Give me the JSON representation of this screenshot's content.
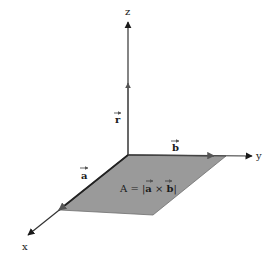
{
  "diagram": {
    "type": "3d-vector-parallelogram",
    "axes": [
      {
        "name": "z",
        "label": "z"
      },
      {
        "name": "y",
        "label": "y"
      },
      {
        "name": "x",
        "label": "x"
      }
    ],
    "vectors": [
      {
        "name": "r",
        "label": "r",
        "along": "z"
      },
      {
        "name": "a",
        "label": "a",
        "along": "x"
      },
      {
        "name": "b",
        "label": "b",
        "along": "y"
      }
    ],
    "area_label": {
      "prefix": "A = |",
      "a": "a",
      "times": " × ",
      "b": "b",
      "suffix": "|"
    },
    "colors": {
      "parallelogram_fill": "#9a9a9a",
      "axis_stroke": "#333333",
      "background": "#ffffff"
    }
  }
}
